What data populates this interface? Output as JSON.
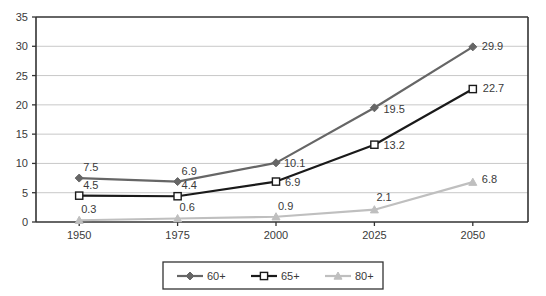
{
  "chart_data": {
    "type": "line",
    "title": "",
    "xlabel": "",
    "ylabel": "",
    "categories": [
      "1950",
      "1975",
      "2000",
      "2025",
      "2050"
    ],
    "x": [
      1950,
      1975,
      2000,
      2025,
      2050
    ],
    "ylim": [
      0,
      35
    ],
    "yticks": [
      0,
      5,
      10,
      15,
      20,
      25,
      30,
      35
    ],
    "ytick_labels": [
      "0",
      "5",
      "10",
      "15",
      "20",
      "25",
      "30",
      "35"
    ],
    "grid": "horizontal",
    "legend_position": "bottom",
    "series": [
      {
        "name": "60+",
        "color": "#666666",
        "marker": "diamond",
        "values": [
          7.5,
          6.9,
          10.1,
          19.5,
          29.9
        ],
        "labels": [
          "7.5",
          "6.9",
          "10.1",
          "19.5",
          "29.9"
        ]
      },
      {
        "name": "65+",
        "color": "#1a1a1a",
        "marker": "square-open",
        "values": [
          4.5,
          4.4,
          6.9,
          13.2,
          22.7
        ],
        "labels": [
          "4.5",
          "4.4",
          "6.9",
          "13.2",
          "22.7"
        ]
      },
      {
        "name": "80+",
        "color": "#bfbfbf",
        "marker": "triangle",
        "values": [
          0.3,
          0.6,
          0.9,
          2.1,
          6.8
        ],
        "labels": [
          "0.3",
          "0.6",
          "0.9",
          "2.1",
          "6.8"
        ]
      }
    ]
  },
  "legend": {
    "items": [
      {
        "label": "60+"
      },
      {
        "label": "65+"
      },
      {
        "label": "80+"
      }
    ]
  },
  "axes": {
    "y_tick_labels": [
      "35",
      "30",
      "25",
      "20",
      "15",
      "10",
      "5",
      "0"
    ],
    "x_tick_labels": [
      "1950",
      "1975",
      "2000",
      "2025",
      "2050"
    ]
  },
  "colors": {
    "series_60plus": "#666666",
    "series_65plus": "#1a1a1a",
    "series_80plus": "#bfbfbf",
    "gridline": "#c8c8c8",
    "axis": "#333333",
    "plot_background": "#ffffff",
    "text": "#3a3a3a"
  },
  "point_label_offsets": {
    "60plus": [
      {
        "dx": 4,
        "dy": -7
      },
      {
        "dx": 4,
        "dy": -7
      },
      {
        "dx": 8,
        "dy": 4
      },
      {
        "dx": 9,
        "dy": 5
      },
      {
        "dx": 9,
        "dy": 3
      }
    ],
    "65plus": [
      {
        "dx": 4,
        "dy": -7
      },
      {
        "dx": 4,
        "dy": -7
      },
      {
        "dx": 9,
        "dy": 4
      },
      {
        "dx": 9,
        "dy": 4
      },
      {
        "dx": 10,
        "dy": 3
      }
    ],
    "80plus": [
      {
        "dx": 2,
        "dy": -7
      },
      {
        "dx": 2,
        "dy": -7
      },
      {
        "dx": 2,
        "dy": -7
      },
      {
        "dx": 2,
        "dy": -9
      },
      {
        "dx": 9,
        "dy": 1
      }
    ]
  }
}
